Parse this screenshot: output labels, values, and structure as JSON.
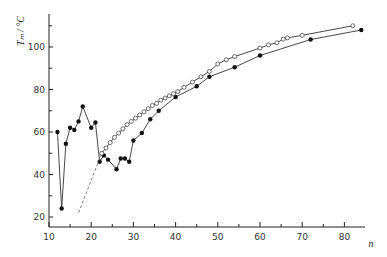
{
  "chart_data": {
    "type": "scatter",
    "title": "",
    "xlabel": "n",
    "ylabel": "T_m / °C",
    "xlim": [
      10,
      86
    ],
    "ylim": [
      16,
      118
    ],
    "xticks": [
      10,
      20,
      30,
      40,
      50,
      60,
      70,
      80
    ],
    "yticks": [
      20,
      40,
      60,
      80,
      100
    ],
    "xminor": [
      15,
      25,
      35,
      45,
      55,
      65,
      75,
      85
    ],
    "yminor": [
      30,
      50,
      70,
      90,
      110
    ],
    "grid": false,
    "legend": null,
    "series": [
      {
        "name": "filled",
        "marker": "filled-circle",
        "line": "solid",
        "x": [
          12,
          13,
          14,
          15,
          16,
          17,
          18,
          20,
          21,
          22,
          23,
          24,
          26,
          27,
          28,
          29,
          30,
          32,
          34,
          36,
          40,
          45,
          48,
          54,
          60,
          72,
          84
        ],
        "y": [
          60,
          24,
          54.5,
          62,
          61,
          65,
          72,
          62,
          64.5,
          46,
          49,
          47,
          42.5,
          47.5,
          47.5,
          46,
          56,
          59.5,
          66,
          70,
          76.5,
          81.5,
          86,
          90.5,
          96,
          103.5,
          108
        ]
      },
      {
        "name": "open",
        "marker": "open-circle",
        "line": "solid",
        "dashed_start": {
          "x": [
            17,
            22.5
          ],
          "y": [
            22,
            50
          ]
        },
        "x": [
          22.5,
          23.5,
          24.5,
          25.5,
          26.5,
          27.5,
          28.5,
          29.5,
          30.5,
          31.5,
          32.5,
          33.5,
          34.5,
          35.5,
          36.5,
          37.5,
          38.5,
          39.5,
          40.5,
          42,
          44,
          46,
          48,
          50,
          52,
          54,
          60,
          62,
          64,
          65.5,
          66.5,
          70,
          82
        ],
        "y": [
          50,
          52.5,
          55,
          57.5,
          59.5,
          61.5,
          63.5,
          65,
          66.5,
          68,
          69.5,
          71,
          72.5,
          73.5,
          75,
          76,
          77,
          78,
          79,
          81,
          83.5,
          86,
          88.5,
          92,
          94,
          95.5,
          99.5,
          101,
          102,
          103.7,
          104.3,
          105.5,
          110
        ]
      }
    ]
  }
}
